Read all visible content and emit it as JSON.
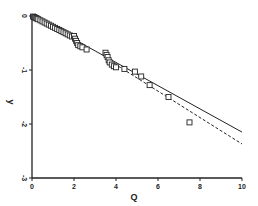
{
  "chart_data": {
    "type": "scatter",
    "title": "",
    "xlabel": "Q",
    "ylabel": "y",
    "xlim": [
      0,
      10
    ],
    "ylim": [
      -3,
      0
    ],
    "grid": false,
    "legend": "none",
    "x_ticks": [
      0,
      2,
      4,
      6,
      8,
      10
    ],
    "x_tick_labels": [
      "0",
      "2",
      "4",
      "6",
      "8",
      "10"
    ],
    "y_ticks": [
      0,
      -1,
      -2,
      -3
    ],
    "y_tick_labels": [
      "0",
      "-1",
      "-2",
      "-3"
    ],
    "series": [
      {
        "name": "data",
        "kind": "points",
        "marker": "square-open",
        "x": [
          0.05,
          0.1,
          0.15,
          0.2,
          0.25,
          0.3,
          0.4,
          0.5,
          0.6,
          0.7,
          0.8,
          0.9,
          1.0,
          1.1,
          1.2,
          1.3,
          1.4,
          1.5,
          1.6,
          1.7,
          1.8,
          1.9,
          2.0,
          2.05,
          2.1,
          2.15,
          2.2,
          2.3,
          2.4,
          2.6,
          3.5,
          3.55,
          3.6,
          3.65,
          3.7,
          3.8,
          3.9,
          4.0,
          4.4,
          4.9,
          5.2,
          5.6,
          6.5,
          7.5
        ],
        "y": [
          -0.01,
          -0.02,
          -0.03,
          -0.04,
          -0.05,
          -0.06,
          -0.08,
          -0.1,
          -0.12,
          -0.14,
          -0.16,
          -0.18,
          -0.2,
          -0.22,
          -0.24,
          -0.26,
          -0.28,
          -0.3,
          -0.32,
          -0.34,
          -0.36,
          -0.38,
          -0.37,
          -0.42,
          -0.46,
          -0.5,
          -0.54,
          -0.56,
          -0.58,
          -0.62,
          -0.68,
          -0.72,
          -0.76,
          -0.82,
          -0.86,
          -0.9,
          -0.93,
          -0.95,
          -0.98,
          -1.03,
          -1.12,
          -1.28,
          -1.5,
          -1.97
        ]
      },
      {
        "name": "fit-solid",
        "kind": "line",
        "style": "solid",
        "x": [
          0,
          10
        ],
        "y": [
          0,
          -2.15
        ]
      },
      {
        "name": "fit-dashed",
        "kind": "line",
        "style": "dashed",
        "x": [
          3.5,
          10
        ],
        "y": [
          -0.78,
          -2.37
        ]
      }
    ]
  }
}
